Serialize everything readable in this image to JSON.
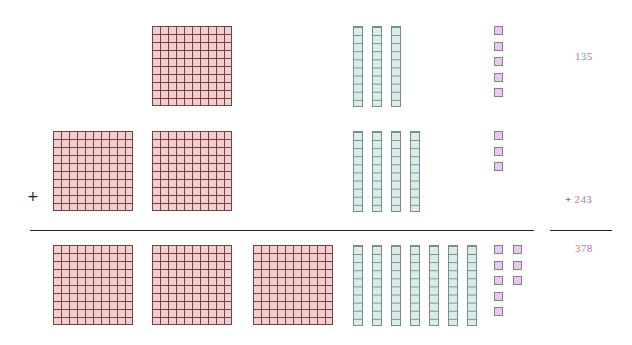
{
  "colors": {
    "hundreds": "#e0707a",
    "tens": "#6a9aa8",
    "ones": "#a070b8",
    "flat_fill": "#f7cccc",
    "rod_fill": "#d8ecec",
    "unit_fill": "#e9c9ef"
  },
  "operator": "+",
  "rows": [
    {
      "name": "addend-1",
      "value": "135",
      "digits": {
        "hundreds": "1",
        "tens": "3",
        "ones": "5"
      },
      "blocks": {
        "hundreds": 1,
        "tens": 3,
        "ones": 5
      }
    },
    {
      "name": "addend-2",
      "value": "243",
      "digits": {
        "hundreds": "2",
        "tens": "4",
        "ones": "3"
      },
      "blocks": {
        "hundreds": 2,
        "tens": 4,
        "ones": 3
      }
    },
    {
      "name": "sum",
      "value": "378",
      "digits": {
        "hundreds": "3",
        "tens": "7",
        "ones": "8"
      },
      "blocks": {
        "hundreds": 3,
        "tens": 7,
        "ones": 8
      }
    }
  ]
}
